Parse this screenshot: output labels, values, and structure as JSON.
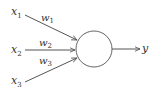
{
  "diagram": {
    "type": "perceptron",
    "inputs": [
      {
        "name": "x",
        "sub": "1"
      },
      {
        "name": "x",
        "sub": "2"
      },
      {
        "name": "x",
        "sub": "3"
      }
    ],
    "weights": [
      {
        "name": "w",
        "sub": "1"
      },
      {
        "name": "w",
        "sub": "2"
      },
      {
        "name": "w",
        "sub": "3"
      }
    ],
    "output": {
      "name": "y"
    },
    "colors": {
      "stroke": "#555555",
      "text": "#333333",
      "background": "#ffffff"
    }
  }
}
